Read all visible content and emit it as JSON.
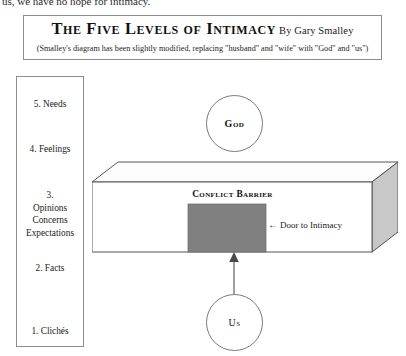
{
  "page": {
    "cut_off_running_text": "us, we have no hope for intimacy."
  },
  "title_panel": {
    "title": "The Five Levels of Intimacy",
    "author_credit": "By Gary Smalley",
    "subtitle": "(Smalley's diagram has been slightly modified, replacing \"husband\" and \"wife\" with \"God\" and \"us\")"
  },
  "levels_panel": {
    "items": [
      {
        "label": "5.  Needs"
      },
      {
        "label": "4.  Feelings"
      },
      {
        "label": "3.\nOpinions\nConcerns\nExpectations"
      },
      {
        "label": "2.  Facts"
      },
      {
        "label": "1.  Clichés"
      }
    ],
    "level_3_lines": {
      "number": "3.",
      "line_1": "Opinions",
      "line_2": "Concerns",
      "line_3": "Expectations"
    }
  },
  "diagram": {
    "god_label": "God",
    "us_label": "Us",
    "conflict_barrier_label": "Conflict Barrier",
    "door_arrow": "←",
    "door_to_intimacy_label": "Door to Intimacy"
  },
  "colors": {
    "border": "#8d8d8d",
    "circle_stroke": "#7b7b7b",
    "box_outline": "#555555",
    "box_front_face": "#ffffff",
    "box_top_face": "#fdfdfd",
    "box_side_face": "#c8c8c8",
    "door_fill": "#808080",
    "text": "#1a1a1a"
  }
}
